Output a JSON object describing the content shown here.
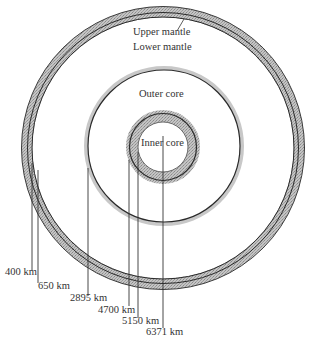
{
  "diagram": {
    "title": "",
    "layers": {
      "upper_mantle": "Upper mantle",
      "lower_mantle": "Lower mantle",
      "outer_core": "Outer core",
      "inner_core": "Inner core"
    },
    "depths": {
      "d400": "400 km",
      "d650": "650 km",
      "d2895": "2895 km",
      "d4700": "4700 km",
      "d5150": "5150 km",
      "d6371": "6371 km"
    },
    "colors": {
      "band_fill": "#b8b8b8",
      "line": "#2a2a2a",
      "background": "#ffffff"
    }
  }
}
